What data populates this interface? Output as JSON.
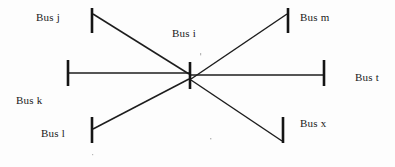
{
  "figure": {
    "type": "power-system-one-line-diagram",
    "background_color": "#fdfdfd",
    "line_color": "#1d1d1d",
    "text_color": "#1a1a1a",
    "width": 395,
    "height": 167
  },
  "central_bus": {
    "id": "bus-i",
    "label": "Bus i",
    "bar": {
      "x": 190,
      "y1": 62,
      "y2": 89,
      "thickness": 2.6
    }
  },
  "buses": [
    {
      "id": "bus-j",
      "label": "Bus j",
      "position": "upper-left",
      "bar": {
        "x": 92,
        "y1": 8,
        "y2": 33,
        "thickness": 2.6
      },
      "line_to_center": {
        "x1": 93,
        "y1": 14,
        "x2": 189,
        "y2": 74
      }
    },
    {
      "id": "bus-m",
      "label": "Bus m",
      "position": "upper-right",
      "bar": {
        "x": 288,
        "y1": 8,
        "y2": 33,
        "thickness": 2.6
      },
      "line_to_center": {
        "x1": 287,
        "y1": 14,
        "x2": 191,
        "y2": 79
      }
    },
    {
      "id": "bus-k",
      "label": "Bus k",
      "position": "left",
      "bar": {
        "x": 68,
        "y1": 60,
        "y2": 86,
        "thickness": 2.6
      },
      "line_to_center": {
        "x1": 69,
        "y1": 73,
        "x2": 189,
        "y2": 73
      }
    },
    {
      "id": "bus-t",
      "label": "Bus t",
      "position": "right",
      "bar": {
        "x": 324,
        "y1": 60,
        "y2": 86,
        "thickness": 2.6
      },
      "line_to_center": {
        "x1": 323,
        "y1": 75,
        "x2": 191,
        "y2": 75
      }
    },
    {
      "id": "bus-l",
      "label": "Bus l",
      "position": "lower-left",
      "bar": {
        "x": 92,
        "y1": 117,
        "y2": 143,
        "thickness": 2.6
      },
      "line_to_center": {
        "x1": 93,
        "y1": 129,
        "x2": 189,
        "y2": 79
      }
    },
    {
      "id": "bus-x",
      "label": "Bus x",
      "position": "lower-right",
      "bar": {
        "x": 283,
        "y1": 117,
        "y2": 143,
        "thickness": 2.6
      },
      "line_to_center": {
        "x1": 282,
        "y1": 141,
        "x2": 191,
        "y2": 80
      }
    }
  ],
  "speckles": [
    {
      "x": 200,
      "y": 53
    },
    {
      "x": 210,
      "y": 138
    },
    {
      "x": 92,
      "y": 154
    }
  ]
}
